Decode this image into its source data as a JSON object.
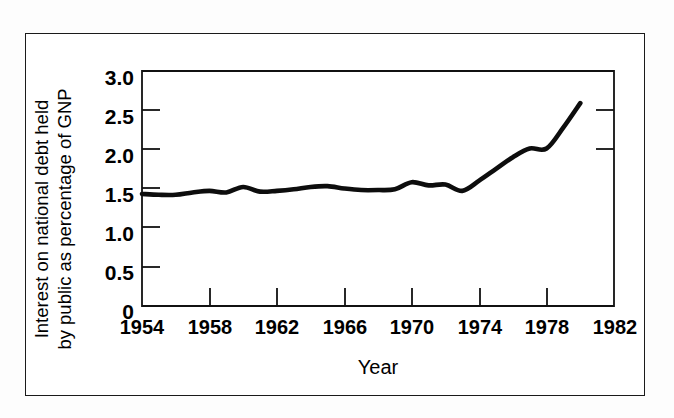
{
  "figure": {
    "background_color": "#fdfdfd",
    "frame_color": "#1a1a1a",
    "plot_background": "#ffffff"
  },
  "chart_data": {
    "type": "line",
    "title": "",
    "subtitle": "",
    "xlabel": "Year",
    "ylabel": "Interest on national debt held by public as percentage of GNP",
    "ylabel_line1": "Interest on national debt held",
    "ylabel_line2": "by public as percentage of GNP",
    "xlim": [
      1954,
      1982
    ],
    "ylim": [
      0,
      3.0
    ],
    "xticks": [
      1954,
      1958,
      1962,
      1966,
      1970,
      1974,
      1978,
      1982
    ],
    "xtick_labels": [
      "1954",
      "1958",
      "1962",
      "1966",
      "1970",
      "1974",
      "1978",
      "1982"
    ],
    "yticks": [
      0,
      0.5,
      1.0,
      1.5,
      2.0,
      2.5,
      3.0
    ],
    "ytick_labels": [
      "0",
      "0.5",
      "1.0",
      "1.5",
      "2.0",
      "2.5",
      "3.0"
    ],
    "grid": false,
    "legend": false,
    "legend_position": "none",
    "line_color": "#0d0d0d",
    "line_width": 4.6,
    "series": [
      {
        "name": "Interest on national debt held by public as percentage of GNP",
        "x": [
          1954,
          1955,
          1956,
          1957,
          1958,
          1959,
          1960,
          1961,
          1962,
          1963,
          1964,
          1965,
          1966,
          1967,
          1968,
          1969,
          1970,
          1971,
          1972,
          1973,
          1974,
          1975,
          1976,
          1977,
          1978,
          1979,
          1980
        ],
        "values": [
          1.43,
          1.42,
          1.42,
          1.45,
          1.47,
          1.45,
          1.52,
          1.46,
          1.47,
          1.49,
          1.52,
          1.53,
          1.5,
          1.48,
          1.48,
          1.49,
          1.58,
          1.54,
          1.55,
          1.47,
          1.6,
          1.75,
          1.9,
          2.01,
          2.01,
          2.28,
          2.59
        ]
      }
    ]
  }
}
